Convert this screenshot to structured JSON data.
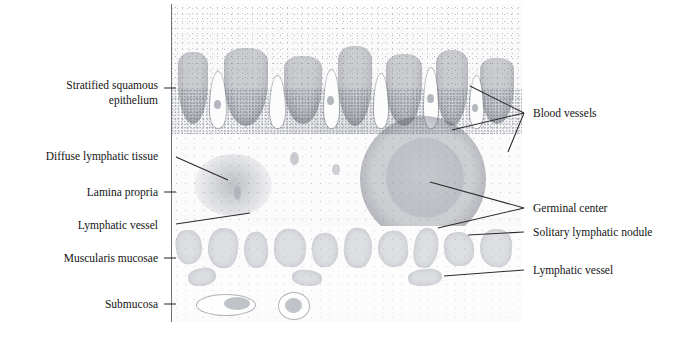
{
  "figure": {
    "signature": "JkMc",
    "ink_color": "#141414",
    "rule_color": "#6c7078"
  },
  "labels_left": [
    {
      "id": "stratified-squamous-epithelium",
      "text": "Stratified squamous\nepithelium"
    },
    {
      "id": "diffuse-lymphatic-tissue",
      "text": "Diffuse lymphatic tissue"
    },
    {
      "id": "lamina-propria",
      "text": "Lamina propria"
    },
    {
      "id": "lymphatic-vessel-left",
      "text": "Lymphatic vessel"
    },
    {
      "id": "muscularis-mucosae",
      "text": "Muscularis mucosae"
    },
    {
      "id": "submucosa",
      "text": "Submucosa"
    }
  ],
  "labels_right": [
    {
      "id": "blood-vessels",
      "text": "Blood vessels"
    },
    {
      "id": "germinal-center",
      "text": "Germinal center"
    },
    {
      "id": "solitary-lymphatic-nodule",
      "text": "Solitary lymphatic nodule"
    },
    {
      "id": "lymphatic-vessel-right",
      "text": "Lymphatic vessel"
    }
  ]
}
